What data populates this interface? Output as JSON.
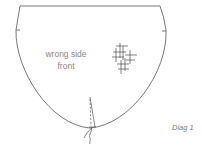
{
  "diagram": {
    "shape": "rounded pocket/bag piece with flat top",
    "labels": {
      "line1": "wrong side",
      "line2": "front"
    },
    "caption": "Diag 1",
    "elements": [
      "outline-top-edge",
      "left-side-notch",
      "right-side-notch",
      "cross-stitch-motif",
      "center-seam-dashed",
      "thread-tails"
    ],
    "colors": {
      "line": "#555555",
      "label": "#8a8a8a",
      "caption": "#7a7a7a",
      "background": "#ffffff"
    }
  }
}
